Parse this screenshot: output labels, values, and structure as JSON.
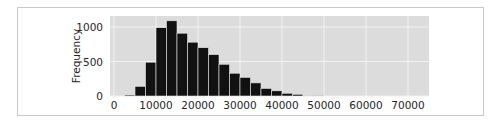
{
  "chart_data": {
    "type": "bar",
    "title": "",
    "xlabel": "",
    "ylabel": "Frequency",
    "xlim": [
      -1000,
      75000
    ],
    "ylim": [
      0,
      1150
    ],
    "bin_width": 2500,
    "x_ticks": [
      0,
      10000,
      20000,
      30000,
      40000,
      50000,
      60000,
      70000
    ],
    "x_tick_labels": [
      "0",
      "10000",
      "20000",
      "30000",
      "40000",
      "50000",
      "60000",
      "70000"
    ],
    "y_ticks": [
      0,
      500,
      1000
    ],
    "y_tick_labels": [
      "0",
      "500",
      "1000"
    ],
    "grid": true,
    "legend": null,
    "categories": [
      "0-2500",
      "2500-5000",
      "5000-7500",
      "7500-10000",
      "10000-12500",
      "12500-15000",
      "15000-17500",
      "17500-20000",
      "20000-22500",
      "22500-25000",
      "25000-27500",
      "27500-30000",
      "30000-32500",
      "32500-35000",
      "35000-37500",
      "37500-40000",
      "40000-42500",
      "42500-45000",
      "45000-47500",
      "47500-50000"
    ],
    "bin_starts": [
      0,
      2500,
      5000,
      7500,
      10000,
      12500,
      15000,
      17500,
      20000,
      22500,
      25000,
      27500,
      30000,
      32500,
      35000,
      37500,
      40000,
      42500,
      45000,
      47500
    ],
    "values": [
      0,
      15,
      140,
      490,
      990,
      1090,
      910,
      780,
      700,
      600,
      460,
      330,
      270,
      190,
      110,
      75,
      40,
      25,
      10,
      3
    ],
    "colors": {
      "bar": "#111111",
      "bar_edge": "#e6e6e6",
      "plot_bg": "#dcdcdc",
      "grid": "#f2f2f2"
    }
  },
  "axes": {
    "ylabel": "Frequency"
  }
}
